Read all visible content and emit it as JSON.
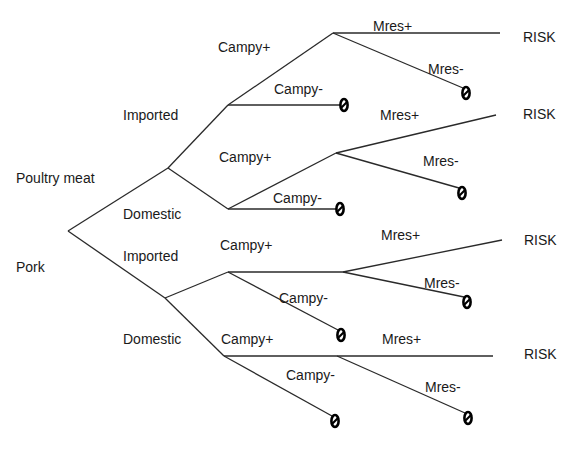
{
  "diagram": {
    "type": "event-tree",
    "root_labels": [
      {
        "id": "poultry",
        "text": "Poultry meat",
        "x": 16,
        "y": 183
      },
      {
        "id": "pork",
        "text": "Pork",
        "x": 16,
        "y": 272
      }
    ],
    "origin_labels": [
      {
        "id": "poultry-imported",
        "text": "Imported",
        "x": 123,
        "y": 120
      },
      {
        "id": "poultry-domestic",
        "text": "Domestic",
        "x": 123,
        "y": 219
      },
      {
        "id": "pork-imported",
        "text": "Imported",
        "x": 123,
        "y": 261
      },
      {
        "id": "pork-domestic",
        "text": "Domestic",
        "x": 123,
        "y": 344
      }
    ],
    "campy_labels": [
      {
        "text": "Campy+",
        "x": 218,
        "y": 52
      },
      {
        "text": "Campy-",
        "x": 274,
        "y": 94
      },
      {
        "text": "Campy+",
        "x": 219,
        "y": 162
      },
      {
        "text": "Campy-",
        "x": 273,
        "y": 203
      },
      {
        "text": "Campy+",
        "x": 220,
        "y": 250
      },
      {
        "text": "Campy-",
        "x": 279,
        "y": 303
      },
      {
        "text": "Campy+",
        "x": 221,
        "y": 344
      },
      {
        "text": "Campy-",
        "x": 286,
        "y": 380
      }
    ],
    "mres_labels": [
      {
        "text": "Mres+",
        "x": 373,
        "y": 31
      },
      {
        "text": "Mres-",
        "x": 428,
        "y": 74
      },
      {
        "text": "Mres+",
        "x": 380,
        "y": 120
      },
      {
        "text": "Mres-",
        "x": 423,
        "y": 166
      },
      {
        "text": "Mres+",
        "x": 381,
        "y": 240
      },
      {
        "text": "Mres-",
        "x": 424,
        "y": 288
      },
      {
        "text": "Mres+",
        "x": 382,
        "y": 344
      },
      {
        "text": "Mres-",
        "x": 425,
        "y": 392
      }
    ],
    "risk_labels": [
      {
        "text": "RISK",
        "x": 523,
        "y": 42
      },
      {
        "text": "RISK",
        "x": 523,
        "y": 119
      },
      {
        "text": "RISK",
        "x": 524,
        "y": 245
      },
      {
        "text": "RISK",
        "x": 524,
        "y": 359
      }
    ],
    "edges": [
      [
        68,
        231,
        168,
        168
      ],
      [
        68,
        231,
        165,
        298
      ],
      [
        168,
        168,
        228,
        105
      ],
      [
        168,
        168,
        228,
        209
      ],
      [
        165,
        298,
        228,
        272
      ],
      [
        165,
        298,
        224,
        356
      ],
      [
        228,
        105,
        333,
        33
      ],
      [
        228,
        105,
        340,
        105
      ],
      [
        333,
        33,
        500,
        33
      ],
      [
        333,
        33,
        463,
        88
      ],
      [
        228,
        209,
        336,
        153
      ],
      [
        228,
        209,
        336,
        209
      ],
      [
        336,
        153,
        496,
        115
      ],
      [
        336,
        153,
        459,
        188
      ],
      [
        228,
        272,
        343,
        272
      ],
      [
        228,
        272,
        338,
        330
      ],
      [
        343,
        272,
        502,
        240
      ],
      [
        343,
        272,
        464,
        297
      ],
      [
        224,
        356,
        337,
        356
      ],
      [
        224,
        356,
        332,
        416
      ],
      [
        337,
        356,
        493,
        356
      ],
      [
        337,
        356,
        465,
        413
      ]
    ],
    "terminal_symbol": "null-outcome-icon",
    "terminals": [
      [
        344,
        105
      ],
      [
        466,
        93
      ],
      [
        340,
        209
      ],
      [
        462,
        193
      ],
      [
        341,
        335
      ],
      [
        467,
        302
      ],
      [
        335,
        421
      ],
      [
        468,
        418
      ]
    ]
  }
}
